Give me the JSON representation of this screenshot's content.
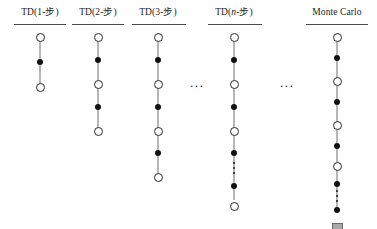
{
  "figure": {
    "caption": "",
    "background_color": "#ffffff",
    "state_node_color": "#ffffff",
    "state_node_border_color": "#2b2b2b",
    "action_node_color": "#111111",
    "terminal_node_color": "#a9a9a9",
    "terminal_node_border_color": "#6a6a6a",
    "spine_color": "#6e6e6e",
    "rule_color": "#4a4a4a"
  },
  "columns": [
    {
      "id": "td-1-step",
      "label_prefix": "TD(1-",
      "label_italic": "",
      "label_suffix": "步)",
      "left": 0,
      "width": 80,
      "rule_left": 14,
      "rule_width": 52,
      "spine_top": 5,
      "spine_height": 50,
      "nodes": [
        {
          "type": "state",
          "top": 0
        },
        {
          "type": "action",
          "top": 26
        },
        {
          "type": "state",
          "top": 50
        }
      ],
      "vdots": null
    },
    {
      "id": "td-2-step",
      "label_prefix": "TD(2-",
      "label_italic": "",
      "label_suffix": "步)",
      "left": 58,
      "width": 80,
      "rule_left": 14,
      "rule_width": 52,
      "spine_top": 5,
      "spine_height": 94,
      "nodes": [
        {
          "type": "state",
          "top": 0
        },
        {
          "type": "action",
          "top": 24
        },
        {
          "type": "state",
          "top": 47
        },
        {
          "type": "action",
          "top": 71
        },
        {
          "type": "state",
          "top": 94
        }
      ],
      "vdots": null
    },
    {
      "id": "td-3-step",
      "label_prefix": "TD(3-",
      "label_italic": "",
      "label_suffix": "步)",
      "left": 118,
      "width": 80,
      "rule_left": 14,
      "rule_width": 54,
      "spine_top": 5,
      "spine_height": 140,
      "nodes": [
        {
          "type": "state",
          "top": 0
        },
        {
          "type": "action",
          "top": 24
        },
        {
          "type": "state",
          "top": 47
        },
        {
          "type": "action",
          "top": 71
        },
        {
          "type": "state",
          "top": 94
        },
        {
          "type": "action",
          "top": 117
        },
        {
          "type": "state",
          "top": 140
        }
      ],
      "vdots": null
    },
    {
      "id": "td-n-step",
      "label_prefix": "TD(",
      "label_italic": "n",
      "label_suffix": "-步)",
      "left": 194,
      "width": 80,
      "rule_left": 14,
      "rule_width": 54,
      "spine_top": 5,
      "spine_height": 162,
      "nodes": [
        {
          "type": "state",
          "top": 0
        },
        {
          "type": "action",
          "top": 24
        },
        {
          "type": "state",
          "top": 47
        },
        {
          "type": "action",
          "top": 71
        },
        {
          "type": "state",
          "top": 94
        },
        {
          "type": "action",
          "top": 117
        },
        {
          "type": "action",
          "top": 150
        },
        {
          "type": "state",
          "top": 169
        }
      ],
      "vdots": {
        "top": 129,
        "count": 3
      }
    },
    {
      "id": "monte-carlo",
      "label_prefix": "Monte Carlo",
      "label_italic": "",
      "label_suffix": "",
      "left": 297,
      "width": 80,
      "rule_left": 9,
      "rule_width": 62,
      "spine_top": 5,
      "spine_height": 175,
      "nodes": [
        {
          "type": "state",
          "top": 0
        },
        {
          "type": "action",
          "top": 22
        },
        {
          "type": "state",
          "top": 44
        },
        {
          "type": "action",
          "top": 66
        },
        {
          "type": "state",
          "top": 88
        },
        {
          "type": "action",
          "top": 110
        },
        {
          "type": "state",
          "top": 129
        },
        {
          "type": "action",
          "top": 148
        },
        {
          "type": "action",
          "top": 174
        },
        {
          "type": "terminal",
          "top": 190
        }
      ],
      "vdots": {
        "top": 157,
        "count": 3
      }
    }
  ],
  "ellipses": [
    {
      "id": "ellipsis-between-td3-tdn",
      "text": "...",
      "left": 190,
      "top": 78
    },
    {
      "id": "ellipsis-between-tdn-mc",
      "text": "...",
      "left": 280,
      "top": 78
    }
  ]
}
